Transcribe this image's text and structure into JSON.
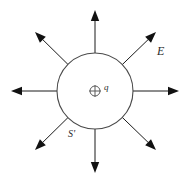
{
  "figure": {
    "background_color": "#ffffff",
    "line_color": "#1a1a1a",
    "surface_color": "#4a4a4a",
    "labels": {
      "field_label": "E",
      "surface_label": "S'",
      "charge_label": "q",
      "charge_symbol": "⊕"
    },
    "gaussian_surface": {
      "shape": "circle",
      "center_x": 95,
      "center_y": 91,
      "radius": 38
    },
    "charge": {
      "symbol_name": "positive-charge-icon",
      "sign": "+",
      "center_x": 95,
      "center_y": 91,
      "radius": 5
    },
    "field_arrows": [
      {
        "name": "field-arrow-up",
        "angle_deg": 90,
        "tip_x": 95,
        "tip_y": 10
      },
      {
        "name": "field-arrow-upper-right",
        "angle_deg": 45,
        "tip_x": 156,
        "tip_y": 32
      },
      {
        "name": "field-arrow-right",
        "angle_deg": 0,
        "tip_x": 179,
        "tip_y": 91
      },
      {
        "name": "field-arrow-lower-right",
        "angle_deg": -45,
        "tip_x": 156,
        "tip_y": 150
      },
      {
        "name": "field-arrow-down",
        "angle_deg": -90,
        "tip_x": 95,
        "tip_y": 173
      },
      {
        "name": "field-arrow-lower-left",
        "angle_deg": 225,
        "tip_x": 35,
        "tip_y": 150
      },
      {
        "name": "field-arrow-left",
        "angle_deg": 180,
        "tip_x": 11,
        "tip_y": 91
      },
      {
        "name": "field-arrow-upper-left",
        "angle_deg": 135,
        "tip_x": 35,
        "tip_y": 32
      }
    ]
  }
}
